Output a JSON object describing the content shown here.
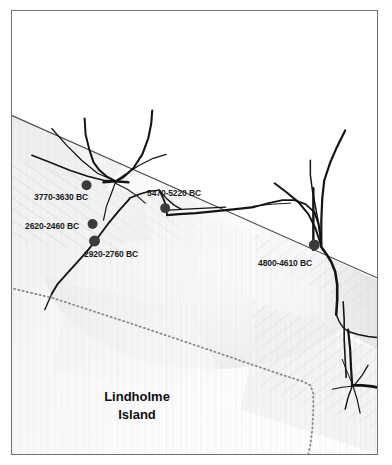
{
  "figure": {
    "width": 392,
    "height": 465,
    "background_color": "#ffffff",
    "frame_color": "#6f7173"
  },
  "map": {
    "type": "hillshade-relief-map",
    "place_label": {
      "line1": "Lindholme",
      "line2": "Island",
      "x": 128,
      "y": 385
    },
    "markers": [
      {
        "id": "site-3770-3630",
        "label": "3770-3630 BC",
        "date_range_bc": [
          3770,
          3630
        ],
        "point": {
          "x": 86,
          "y": 185
        },
        "label_pos": {
          "x": 33,
          "y": 191
        },
        "label_anchor": "below-left",
        "color": "#3b3b3b"
      },
      {
        "id": "site-5470-5220",
        "label": "5470-5220 BC",
        "date_range_bc": [
          5470,
          5220
        ],
        "point": {
          "x": 165,
          "y": 208
        },
        "label_pos": {
          "x": 146,
          "y": 188
        },
        "label_anchor": "above-right",
        "color": "#3b3b3b"
      },
      {
        "id": "site-2620-2460",
        "label": "2620-2460 BC",
        "date_range_bc": [
          2620,
          2460
        ],
        "point": {
          "x": 92,
          "y": 224
        },
        "label_pos": {
          "x": 24,
          "y": 220
        },
        "label_anchor": "left",
        "color": "#3b3b3b"
      },
      {
        "id": "site-2920-2760",
        "label": "2920-2760 BC",
        "date_range_bc": [
          2920,
          2760
        ],
        "point": {
          "x": 94,
          "y": 241
        },
        "label_pos": {
          "x": 83,
          "y": 249
        },
        "label_anchor": "below-right",
        "color": "#3b3b3b"
      },
      {
        "id": "site-4800-4610",
        "label": "4800-4610 BC",
        "date_range_bc": [
          4800,
          4610
        ],
        "point": {
          "x": 315,
          "y": 245
        },
        "label_pos": {
          "x": 257,
          "y": 257
        },
        "label_anchor": "below-left",
        "color": "#3b3b3b"
      }
    ],
    "features": {
      "upland_boundary_line": "straight diagonal from upper-left to right edge",
      "island_boundary_line": "dotted line running diagonally then turning south",
      "drainage_color": "#111111",
      "dotted_boundary_color": "#8a8a8a"
    }
  }
}
